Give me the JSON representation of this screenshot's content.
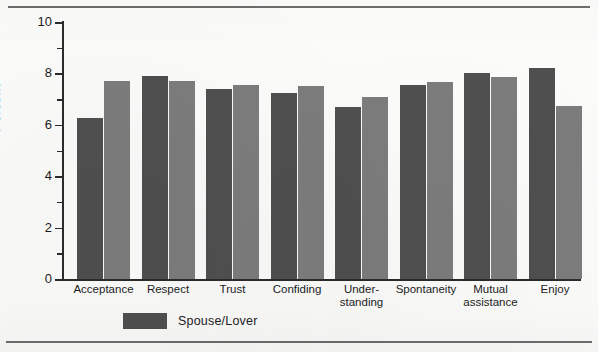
{
  "chart_data": {
    "type": "bar",
    "title": "",
    "xlabel": "",
    "ylabel": "Percent",
    "ylim": [
      0,
      10
    ],
    "yticks": [
      0,
      2,
      4,
      6,
      8,
      10
    ],
    "ytick_labels": [
      "0",
      "2",
      "4",
      "6",
      "8",
      "10"
    ],
    "minor_ticks": [
      1,
      3,
      5,
      7,
      9
    ],
    "grid": false,
    "legend_position": "below-axis-left",
    "categories": [
      "Acceptance",
      "Respect",
      "Trust",
      "Confiding",
      "Under-\nstanding",
      "Spontaneity",
      "Mutual\nassistance",
      "Enjoy"
    ],
    "series": [
      {
        "name": "Spouse/Lover",
        "color": "#4f4f4f",
        "values": [
          6.25,
          7.9,
          7.4,
          7.25,
          6.7,
          7.55,
          8.0,
          8.2
        ]
      },
      {
        "name": "",
        "color": "#7c7c7c",
        "values": [
          7.7,
          7.7,
          7.55,
          7.5,
          7.1,
          7.65,
          7.85,
          6.75
        ]
      }
    ]
  },
  "axes": {
    "y_title": "Percent",
    "y_labels": [
      "10",
      "8",
      "6",
      "4",
      "2",
      "0"
    ]
  },
  "legend": {
    "entries": [
      {
        "label": "Spouse/Lover",
        "color": "#4f4f4f"
      }
    ]
  },
  "colors": {
    "series_1": "#4f4f4f",
    "series_2": "#7c7c7c",
    "axis": "#2b2b2b",
    "rule": "#6d6d6d",
    "page": "#fbfbfa"
  }
}
